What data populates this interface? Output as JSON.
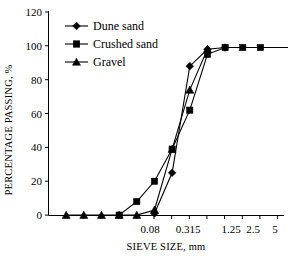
{
  "chart_data": {
    "type": "line",
    "title": "",
    "xlabel": "SIEVE SIZE, mm",
    "ylabel": "PERCENTAGE PASSING, %",
    "ylim": [
      0,
      120
    ],
    "yticks": [
      0,
      20,
      40,
      60,
      80,
      100,
      120
    ],
    "ytick_labels": [
      "0",
      "20",
      "40",
      "60",
      "80",
      "100",
      "120"
    ],
    "x_scale": "log-sieve-categorical",
    "x_tick_labels": [
      "",
      "",
      "",
      "",
      "",
      "0.08",
      "",
      "0.315",
      "",
      "",
      "1.25",
      "2.5",
      "",
      "5"
    ],
    "x_labeled_ticks": [
      {
        "label": "0.08",
        "index": 5
      },
      {
        "label": "0.315",
        "index": 7
      },
      {
        "label": "1.25",
        "index": 10
      },
      {
        "label": "2.5",
        "index": 11
      },
      {
        "label": "5",
        "index": 13
      }
    ],
    "x_categories": [
      "0.008",
      "0.012",
      "0.02",
      "0.03",
      "0.05",
      "0.08",
      "0.16",
      "0.315",
      "0.5",
      "0.8",
      "1.25",
      "2.5",
      "3.5",
      "5"
    ],
    "grid": false,
    "legend_position": "top-left",
    "series": [
      {
        "name": "Dune sand",
        "marker": "diamond",
        "color": "#000000",
        "values": [
          null,
          null,
          null,
          null,
          null,
          1,
          25,
          88,
          98,
          99,
          null,
          null,
          null,
          null
        ],
        "points": [
          {
            "x_index": 5,
            "y": 1
          },
          {
            "x_index": 6,
            "y": 25
          },
          {
            "x_index": 7,
            "y": 88
          },
          {
            "x_index": 8,
            "y": 98
          },
          {
            "x_index": 9,
            "y": 99
          }
        ]
      },
      {
        "name": "Crushed sand",
        "marker": "square",
        "color": "#000000",
        "values": [
          null,
          null,
          null,
          0,
          8,
          20,
          39,
          62,
          95,
          98,
          99,
          99,
          null,
          99
        ],
        "points": [
          {
            "x_index": 3,
            "y": 0
          },
          {
            "x_index": 4,
            "y": 8
          },
          {
            "x_index": 5,
            "y": 20
          },
          {
            "x_index": 6,
            "y": 39
          },
          {
            "x_index": 7,
            "y": 62
          },
          {
            "x_index": 8,
            "y": 95
          },
          {
            "x_index": 9,
            "y": 99
          },
          {
            "x_index": 10,
            "y": 99
          },
          {
            "x_index": 11,
            "y": 99
          },
          {
            "x_index": 13,
            "y": 99
          }
        ]
      },
      {
        "name": "Gravel",
        "marker": "triangle",
        "color": "#000000",
        "values": [
          0,
          0,
          0,
          0,
          0,
          3,
          39,
          74,
          98,
          null,
          null,
          null,
          null,
          null
        ],
        "points": [
          {
            "x_index": 0,
            "y": 0
          },
          {
            "x_index": 1,
            "y": 0
          },
          {
            "x_index": 2,
            "y": 0
          },
          {
            "x_index": 3,
            "y": 0
          },
          {
            "x_index": 4,
            "y": 0
          },
          {
            "x_index": 5,
            "y": 3
          },
          {
            "x_index": 6,
            "y": 39
          },
          {
            "x_index": 7,
            "y": 74
          },
          {
            "x_index": 8,
            "y": 98
          }
        ]
      }
    ]
  },
  "legend": {
    "items": [
      {
        "label": "Dune sand",
        "marker": "diamond-icon"
      },
      {
        "label": "Crushed sand",
        "marker": "square-icon"
      },
      {
        "label": "Gravel",
        "marker": "triangle-icon"
      }
    ]
  },
  "axes": {
    "y_title": "PERCENTAGE PASSING, %",
    "x_title": "SIEVE SIZE, mm",
    "y_labels": [
      "120",
      "100",
      "80",
      "60",
      "40",
      "20",
      "0"
    ],
    "x_labels": [
      "0.08",
      "0.315",
      "1.25",
      "2.5",
      "5"
    ]
  }
}
